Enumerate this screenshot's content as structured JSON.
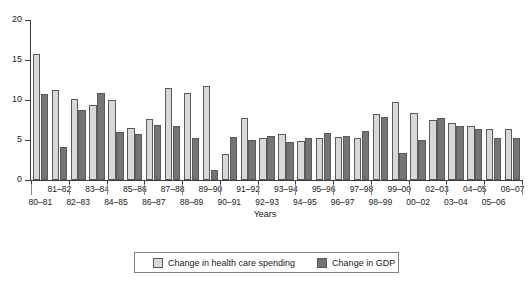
{
  "chart_data": {
    "type": "bar",
    "title": "",
    "xlabel": "Years",
    "ylabel": "",
    "ylim": [
      0,
      20
    ],
    "yticks": [
      0,
      5,
      10,
      15,
      20
    ],
    "grid": false,
    "legend_position": "bottom",
    "categories": [
      "80–81",
      "81–82",
      "82–83",
      "83–84",
      "84–85",
      "85–86",
      "86–87",
      "87–88",
      "88–89",
      "89–90",
      "90–91",
      "91–92",
      "92–93",
      "93–94",
      "94–95",
      "95–96",
      "96–97",
      "97–98",
      "98–99",
      "99–00",
      "00–02",
      "02–03",
      "03–04",
      "04–05",
      "05–06",
      "06–07"
    ],
    "series": [
      {
        "name": "Change in health care spending",
        "color": "#d8d8d8",
        "values": [
          15.8,
          11.3,
          10.1,
          9.4,
          10.0,
          6.5,
          7.6,
          11.5,
          10.9,
          11.7,
          3.3,
          7.7,
          5.2,
          5.7,
          4.9,
          5.2,
          5.4,
          5.2,
          8.3,
          9.7,
          8.4,
          7.5,
          7.1,
          6.8,
          6.4,
          6.4
        ]
      },
      {
        "name": "Change in GDP",
        "color": "#757575",
        "values": [
          10.7,
          4.1,
          8.7,
          10.9,
          6.0,
          5.8,
          6.9,
          6.8,
          5.2,
          1.2,
          5.4,
          5.0,
          5.5,
          4.7,
          5.3,
          5.9,
          5.5,
          6.1,
          7.9,
          3.4,
          5.0,
          7.8,
          6.8,
          6.4,
          5.2,
          5.2
        ]
      }
    ]
  },
  "axis": {
    "y_tick_labels": [
      "20",
      "15",
      "10",
      "5",
      "0"
    ],
    "x_title": "Years",
    "x_labels_upper": [
      "81–82",
      "83–84",
      "85–86",
      "87–88",
      "89–90",
      "91–92",
      "93–94",
      "95–96",
      "97–98",
      "99–00",
      "02–03",
      "04–05",
      "06–07"
    ],
    "x_labels_lower": [
      "80–81",
      "82–83",
      "84–85",
      "86–87",
      "88–89",
      "90–91",
      "92–93",
      "94–95",
      "96–97",
      "98–99",
      "00–02",
      "03–04",
      "05–06"
    ]
  },
  "legend": {
    "items": [
      {
        "label": "Change in health care spending",
        "color": "#d8d8d8",
        "swatch_name": "legend-swatch-health-care-spending"
      },
      {
        "label": "Change in GDP",
        "color": "#757575",
        "swatch_name": "legend-swatch-gdp"
      }
    ]
  }
}
